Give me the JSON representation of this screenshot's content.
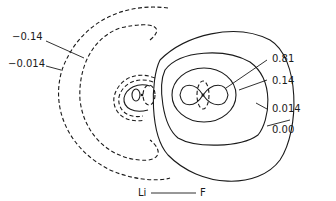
{
  "diagram": {
    "title": "",
    "axis": {
      "left_atom": "Li",
      "right_atom": "F"
    },
    "contour_labels_left": [
      {
        "value": "−0.14",
        "style": "dashed"
      },
      {
        "value": "−0.014",
        "style": "dashed"
      }
    ],
    "contour_labels_right": [
      {
        "value": "0.81",
        "style": "solid"
      },
      {
        "value": "0.14",
        "style": "solid"
      },
      {
        "value": "0.014",
        "style": "solid"
      },
      {
        "value": "0.00",
        "style": "solid"
      }
    ],
    "line_color": "#1a1a1a",
    "background": "#ffffff"
  }
}
